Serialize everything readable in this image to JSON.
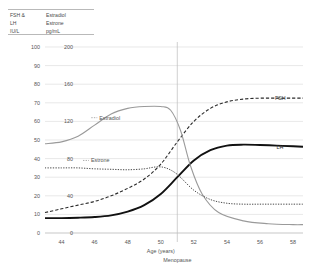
{
  "units_key": {
    "left_column": [
      "FSH &",
      "LH",
      "IU/L"
    ],
    "right_column": [
      "Estradiol",
      "Estrone",
      "pg/mL"
    ]
  },
  "chart_data": {
    "type": "line",
    "title": "",
    "xlabel": "Age (years)",
    "ylabel_left": "FSH & LH IU/L",
    "ylabel_right": "Estradiol Estrone pg/mL",
    "xlim": [
      43,
      58.6
    ],
    "xticks": [
      44,
      46,
      48,
      50,
      52,
      54,
      56,
      58
    ],
    "ylim_left": [
      0,
      100
    ],
    "yticks_left": [
      0,
      10,
      20,
      30,
      40,
      50,
      60,
      70,
      80,
      90,
      100
    ],
    "ylim_right": [
      0,
      200
    ],
    "yticks_right": [
      0,
      40,
      80,
      120,
      160,
      200
    ],
    "grid": true,
    "legend_position": "inline-labels",
    "annotations": [
      {
        "name": "menopause-marker",
        "label": "Menopause",
        "x": 51
      }
    ],
    "series": [
      {
        "name": "FSH",
        "label": "FSH",
        "axis": "left",
        "unit": "IU/L",
        "style": "dashed",
        "label_x": 56.9,
        "label_y": 72.5,
        "x": [
          43.0,
          44,
          45,
          46,
          47,
          48,
          49,
          50,
          51,
          52,
          53,
          54,
          55,
          56,
          57,
          58,
          58.6
        ],
        "values": [
          11,
          13,
          15,
          17,
          20,
          24,
          29,
          37,
          49,
          60,
          67,
          70.5,
          72,
          72.5,
          72.5,
          72.5,
          72.5
        ]
      },
      {
        "name": "LH",
        "label": "LH",
        "axis": "left",
        "unit": "IU/L",
        "style": "solid-bold",
        "label_x": 57.0,
        "label_y": 46.5,
        "x": [
          43.0,
          44,
          45,
          46,
          47,
          48,
          49,
          50,
          51,
          52,
          53,
          54,
          55,
          56,
          57,
          58,
          58.6
        ],
        "values": [
          8,
          8,
          8.2,
          8.6,
          9.5,
          11.5,
          15,
          21,
          30,
          39,
          44.5,
          47,
          47.5,
          47.3,
          47,
          46.6,
          46.4
        ]
      },
      {
        "name": "Estradiol",
        "label": "Estradiol",
        "axis": "right",
        "unit": "pg/mL",
        "style": "solid-grey",
        "label_x": 46.1,
        "label_y": 124,
        "x": [
          43.0,
          44,
          45,
          46,
          47,
          48,
          49,
          50,
          50.6,
          51.2,
          51.8,
          52.5,
          53.5,
          55,
          56.5,
          58,
          58.6
        ],
        "values": [
          96,
          98,
          104,
          116,
          128,
          134,
          136,
          136,
          132,
          110,
          72,
          42,
          22,
          13,
          10,
          9,
          9
        ]
      },
      {
        "name": "Estrone",
        "label": "Estrone",
        "axis": "right",
        "unit": "pg/mL",
        "style": "dotted",
        "label_x": 45.6,
        "label_y": 78,
        "x": [
          43.0,
          44,
          45,
          46,
          47,
          48,
          49,
          49.7,
          50.3,
          51,
          52,
          53,
          54,
          55,
          56,
          57,
          58,
          58.6
        ],
        "values": [
          70,
          70,
          70,
          69,
          68.5,
          68,
          69,
          71,
          70,
          63,
          46,
          36,
          32,
          31,
          31,
          31,
          31,
          31
        ]
      }
    ]
  }
}
